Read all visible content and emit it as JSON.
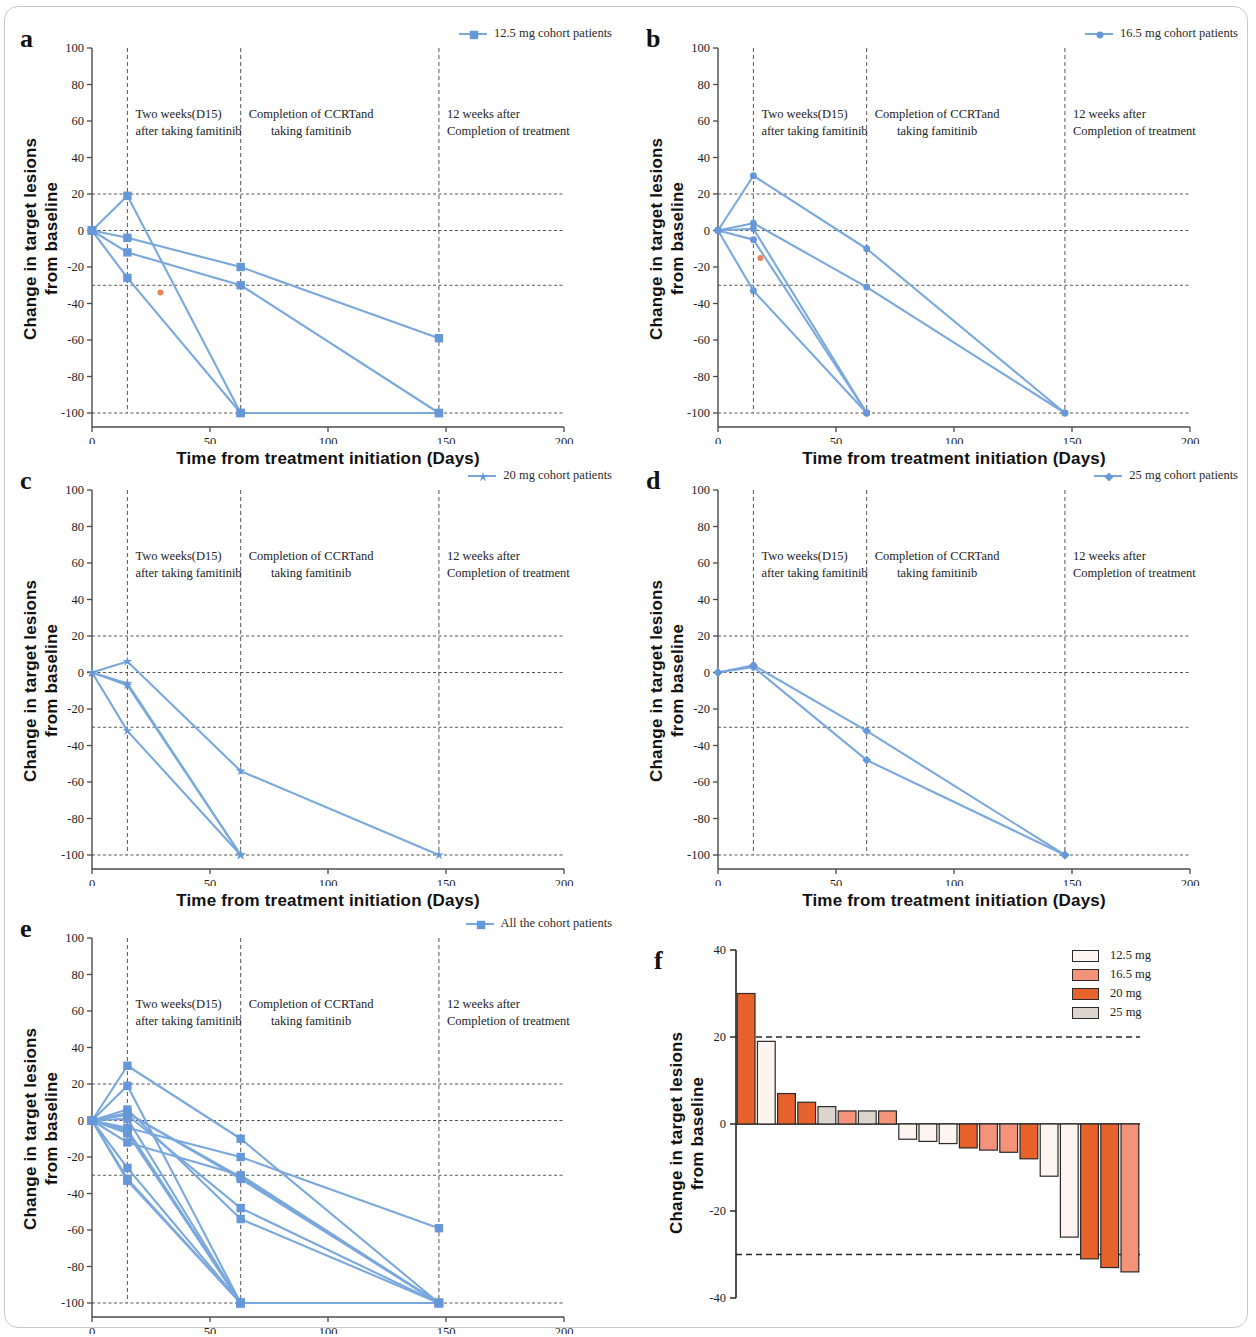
{
  "figure": {
    "axis_titles": {
      "y": "Change in target lesions\nfrom baseline",
      "y_line1": "Change in target lesions",
      "y_line2": "from baseline",
      "x": "Time from treatment initiation (Days)"
    },
    "annotations": {
      "a1_line1": "Two weeks(D15)",
      "a1_line2": "after taking famitinib",
      "a2_line1": "Completion of CCRTand",
      "a2_line2": "taking  famitinib",
      "a3_line1": "12 weeks after",
      "a3_line2": "Completion of treatment"
    },
    "line_color": "#7aa8dd",
    "marker_color": "#6697d8",
    "highlight_color": "#e8835a",
    "axis_color": "#4a4a4a",
    "guide_color": "#555555"
  },
  "panels": [
    {
      "letter": "a",
      "legend_label": "12.5 mg cohort patients",
      "marker": "square",
      "chart_data": {
        "type": "line",
        "title": "12.5 mg cohort patients",
        "xlabel": "Time from treatment initiation (Days)",
        "ylabel": "Change in target lesions from baseline",
        "xlim": [
          0,
          200
        ],
        "ylim": [
          -100,
          100
        ],
        "xticks": [
          0,
          50,
          100,
          150,
          200
        ],
        "yticks": [
          -100,
          -80,
          -60,
          -40,
          -20,
          0,
          20,
          40,
          60,
          80,
          100
        ],
        "grid": "dashed reference lines at y = 20, 0, -30, -100; vertical dashed lines at x = 15, 63, 147",
        "vlines": [
          15,
          63,
          147
        ],
        "hlines": [
          20,
          0,
          -30,
          -100
        ],
        "legend_position": "top-right",
        "series": [
          {
            "name": "pt1",
            "x": [
              0,
              15,
              63,
              147
            ],
            "y": [
              0,
              19,
              -100,
              -100
            ]
          },
          {
            "name": "pt2",
            "x": [
              0,
              15,
              63,
              147
            ],
            "y": [
              0,
              -4,
              -20,
              -59
            ]
          },
          {
            "name": "pt3",
            "x": [
              0,
              15,
              63,
              147
            ],
            "y": [
              0,
              -12,
              -30,
              -100
            ]
          },
          {
            "name": "pt4",
            "x": [
              0,
              15,
              63
            ],
            "y": [
              0,
              -26,
              -100
            ]
          }
        ],
        "annotation_points": [
          {
            "x": 29,
            "y": -34,
            "color": "#e8835a"
          }
        ]
      }
    },
    {
      "letter": "b",
      "legend_label": "16.5 mg cohort patients",
      "marker": "circle",
      "chart_data": {
        "type": "line",
        "title": "16.5 mg cohort patients",
        "xlabel": "Time from treatment initiation (Days)",
        "ylabel": "Change in target lesions from baseline",
        "xlim": [
          0,
          200
        ],
        "ylim": [
          -100,
          100
        ],
        "xticks": [
          0,
          50,
          100,
          150,
          200
        ],
        "yticks": [
          -100,
          -80,
          -60,
          -40,
          -20,
          0,
          20,
          40,
          60,
          80,
          100
        ],
        "vlines": [
          15,
          63,
          147
        ],
        "hlines": [
          20,
          0,
          -30,
          -100
        ],
        "legend_position": "top-right",
        "series": [
          {
            "name": "pt1",
            "x": [
              0,
              15,
              63,
              147
            ],
            "y": [
              0,
              30,
              -10,
              -100
            ]
          },
          {
            "name": "pt2",
            "x": [
              0,
              15,
              63,
              147
            ],
            "y": [
              0,
              4,
              -31,
              -100
            ]
          },
          {
            "name": "pt3",
            "x": [
              0,
              15,
              63
            ],
            "y": [
              0,
              1,
              -100
            ]
          },
          {
            "name": "pt4",
            "x": [
              0,
              15,
              63
            ],
            "y": [
              0,
              -5,
              -100
            ]
          },
          {
            "name": "pt5",
            "x": [
              0,
              15,
              63
            ],
            "y": [
              0,
              -33,
              -100
            ]
          }
        ],
        "annotation_points": [
          {
            "x": 18,
            "y": -15,
            "color": "#e8835a"
          }
        ]
      }
    },
    {
      "letter": "c",
      "legend_label": "20 mg cohort patients",
      "marker": "star",
      "chart_data": {
        "type": "line",
        "title": "20 mg cohort patients",
        "xlabel": "Time from treatment initiation (Days)",
        "ylabel": "Change in target lesions from baseline",
        "xlim": [
          0,
          200
        ],
        "ylim": [
          -100,
          100
        ],
        "xticks": [
          0,
          50,
          100,
          150,
          200
        ],
        "yticks": [
          -100,
          -80,
          -60,
          -40,
          -20,
          0,
          20,
          40,
          60,
          80,
          100
        ],
        "vlines": [
          15,
          63,
          147
        ],
        "hlines": [
          20,
          0,
          -30,
          -100
        ],
        "legend_position": "top-right",
        "series": [
          {
            "name": "pt1",
            "x": [
              0,
              15,
              63,
              147
            ],
            "y": [
              0,
              6,
              -54,
              -100
            ]
          },
          {
            "name": "pt2",
            "x": [
              0,
              15,
              63
            ],
            "y": [
              0,
              -6,
              -100
            ]
          },
          {
            "name": "pt3",
            "x": [
              0,
              15,
              63
            ],
            "y": [
              0,
              -7,
              -100
            ]
          },
          {
            "name": "pt4",
            "x": [
              0,
              15,
              63
            ],
            "y": [
              0,
              -32,
              -100
            ]
          }
        ],
        "annotation_points": []
      }
    },
    {
      "letter": "d",
      "legend_label": "25 mg cohort patients",
      "marker": "diamond",
      "chart_data": {
        "type": "line",
        "title": "25 mg cohort patients",
        "xlabel": "Time from treatment initiation (Days)",
        "ylabel": "Change in target lesions from baseline",
        "xlim": [
          0,
          200
        ],
        "ylim": [
          -100,
          100
        ],
        "xticks": [
          0,
          50,
          100,
          150,
          200
        ],
        "yticks": [
          -100,
          -80,
          -60,
          -40,
          -20,
          0,
          20,
          40,
          60,
          80,
          100
        ],
        "vlines": [
          15,
          63,
          147
        ],
        "hlines": [
          20,
          0,
          -30,
          -100
        ],
        "legend_position": "top-right",
        "series": [
          {
            "name": "pt1",
            "x": [
              0,
              15,
              63,
              147
            ],
            "y": [
              0,
              4,
              -32,
              -100
            ]
          },
          {
            "name": "pt2",
            "x": [
              0,
              15,
              63,
              147
            ],
            "y": [
              0,
              3,
              -48,
              -100
            ]
          }
        ],
        "annotation_points": []
      }
    },
    {
      "letter": "e",
      "legend_label": "All the cohort patients",
      "marker": "square",
      "chart_data": {
        "type": "line",
        "title": "All the cohort patients",
        "xlabel": "Time from treatment initiation (Days)",
        "ylabel": "Change in target lesions from baseline",
        "xlim": [
          0,
          200
        ],
        "ylim": [
          -100,
          100
        ],
        "xticks": [
          0,
          50,
          100,
          150,
          200
        ],
        "yticks": [
          -100,
          -80,
          -60,
          -40,
          -20,
          0,
          20,
          40,
          60,
          80,
          100
        ],
        "vlines": [
          15,
          63,
          147
        ],
        "hlines": [
          20,
          0,
          -30,
          -100
        ],
        "legend_position": "top-right",
        "series": [
          {
            "name": "pt1",
            "x": [
              0,
              15,
              63,
              147
            ],
            "y": [
              0,
              30,
              -10,
              -100
            ]
          },
          {
            "name": "pt2",
            "x": [
              0,
              15,
              63,
              147
            ],
            "y": [
              0,
              19,
              -100,
              -100
            ]
          },
          {
            "name": "pt3",
            "x": [
              0,
              15,
              63,
              147
            ],
            "y": [
              0,
              6,
              -54,
              -100
            ]
          },
          {
            "name": "pt4",
            "x": [
              0,
              15,
              63,
              147
            ],
            "y": [
              0,
              4,
              -32,
              -100
            ]
          },
          {
            "name": "pt5",
            "x": [
              0,
              15,
              63,
              147
            ],
            "y": [
              0,
              3,
              -48,
              -100
            ]
          },
          {
            "name": "pt6",
            "x": [
              0,
              15,
              63,
              147
            ],
            "y": [
              0,
              4,
              -31,
              -100
            ]
          },
          {
            "name": "pt7",
            "x": [
              0,
              15,
              63,
              147
            ],
            "y": [
              0,
              -4,
              -20,
              -59
            ]
          },
          {
            "name": "pt8",
            "x": [
              0,
              15,
              63,
              147
            ],
            "y": [
              0,
              -12,
              -30,
              -100
            ]
          },
          {
            "name": "pt9",
            "x": [
              0,
              15,
              63
            ],
            "y": [
              0,
              1,
              -100
            ]
          },
          {
            "name": "pt10",
            "x": [
              0,
              15,
              63
            ],
            "y": [
              0,
              -5,
              -100
            ]
          },
          {
            "name": "pt11",
            "x": [
              0,
              15,
              63
            ],
            "y": [
              0,
              -6,
              -100
            ]
          },
          {
            "name": "pt12",
            "x": [
              0,
              15,
              63
            ],
            "y": [
              0,
              -7,
              -100
            ]
          },
          {
            "name": "pt13",
            "x": [
              0,
              15,
              63
            ],
            "y": [
              0,
              -26,
              -100
            ]
          },
          {
            "name": "pt14",
            "x": [
              0,
              15,
              63
            ],
            "y": [
              0,
              -32,
              -100
            ]
          },
          {
            "name": "pt15",
            "x": [
              0,
              15,
              63
            ],
            "y": [
              0,
              -33,
              -100
            ]
          }
        ],
        "annotation_points": []
      }
    }
  ],
  "waterfall": {
    "letter": "f",
    "legend": [
      {
        "label": "12.5 mg",
        "color": "#fdf4f0"
      },
      {
        "label": "16.5 mg",
        "color": "#f4937a"
      },
      {
        "label": "20 mg",
        "color": "#e8622c"
      },
      {
        "label": "25 mg",
        "color": "#ded4ce"
      }
    ],
    "chart_data": {
      "type": "bar",
      "title": "",
      "xlabel": "",
      "ylabel": "Change in target lesions from baseline",
      "ylim": [
        -40,
        40
      ],
      "yticks": [
        -40,
        -20,
        0,
        20,
        40
      ],
      "hlines": [
        20,
        -30
      ],
      "grid": "dashed reference lines at y = 20 and y = -30",
      "legend_position": "top-right",
      "bar_outline": "#2a2a2a",
      "values": [
        30,
        19,
        7,
        5,
        4,
        3,
        3,
        3,
        -3.5,
        -4,
        -4.5,
        -5.5,
        -6,
        -6.5,
        -8,
        -12,
        -26,
        -31,
        -33,
        -34
      ],
      "cohorts": [
        "20 mg",
        "12.5 mg",
        "20 mg",
        "20 mg",
        "25 mg",
        "16.5 mg",
        "25 mg",
        "16.5 mg",
        "12.5 mg",
        "12.5 mg",
        "12.5 mg",
        "20 mg",
        "16.5 mg",
        "16.5 mg",
        "20 mg",
        "12.5 mg",
        "12.5 mg",
        "20 mg",
        "20 mg",
        "16.5 mg"
      ]
    }
  }
}
